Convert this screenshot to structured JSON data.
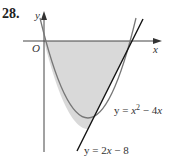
{
  "problem_number": "28.",
  "axes": {
    "x_label": "x",
    "y_label": "y",
    "origin_label": "O"
  },
  "curves": [
    {
      "name": "parabola",
      "equation_text": "y = x² − 4x",
      "lhs": "y = ",
      "var": "x",
      "exp": "2",
      "rest": " − 4",
      "rest_var": "x"
    },
    {
      "name": "line",
      "equation_text": "y = 2x − 8",
      "lhs": "y = 2",
      "var": "x",
      "rest": " − 8"
    }
  ],
  "shaded_region": "between y = x^2 - 4x and x-axis / line, from x=0 to x=4",
  "colors": {
    "shade": "#d9d9d9",
    "parabola": "#777777",
    "line": "#111111",
    "axis": "#444444"
  }
}
